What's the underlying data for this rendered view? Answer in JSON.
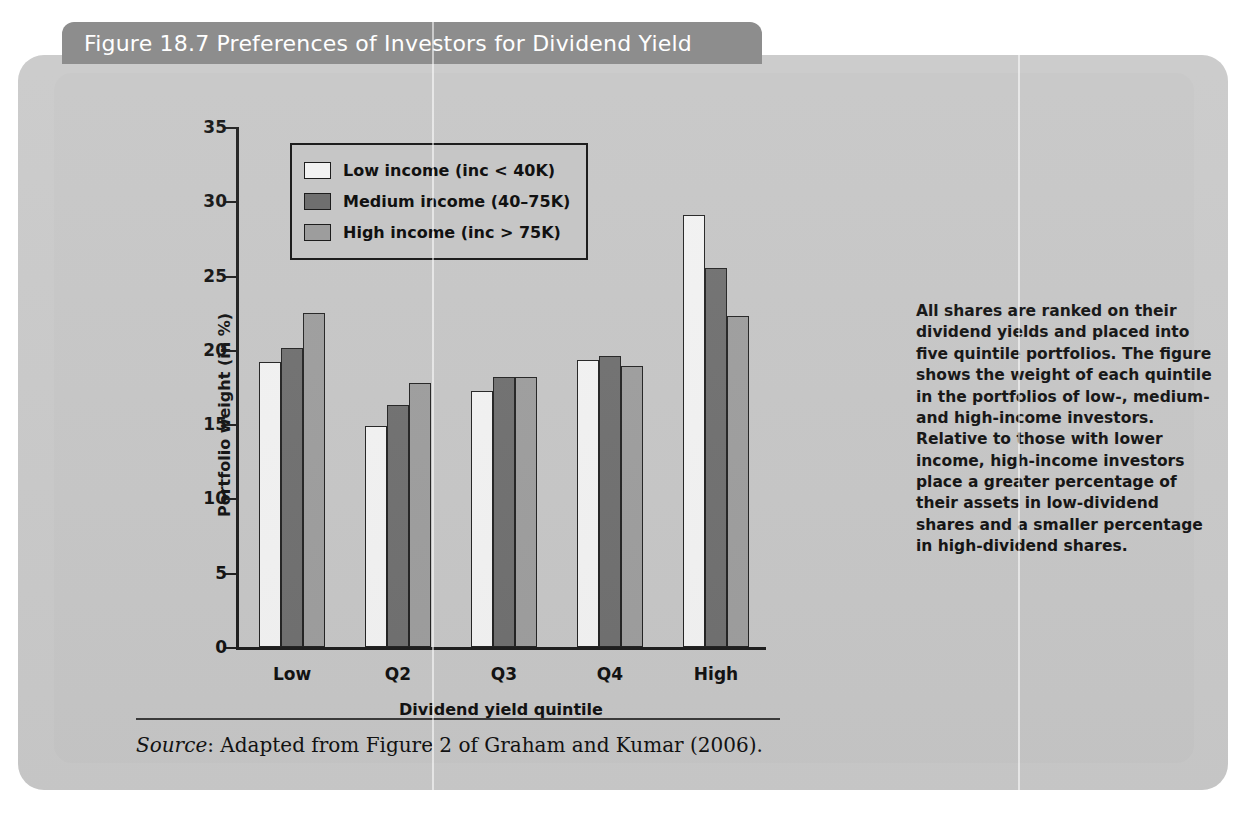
{
  "figure": {
    "title": "Figure 18.7  Preferences of Investors for Dividend Yield",
    "source_prefix": "Source",
    "source_text": ": Adapted from Figure 2 of Graham and Kumar (2006).",
    "caption": "All shares are ranked on their dividend yields and placed into five quintile portfolios. The figure shows the weight of each quintile in the portfolios of low-, medium- and high-income investors. Relative to those with lower income, high-income investors place a greater percentage of their assets in low-dividend shares and a smaller percentage in high-dividend shares."
  },
  "colors": {
    "card": "#c9c9c9",
    "plate": "#c6c6c6",
    "title_tab": "#8d8d8d",
    "title_text": "#ffffff",
    "axis": "#1d1d1d",
    "series_low": "#f2f2f2",
    "series_medium": "#6f6f6f",
    "series_high": "#9d9d9d"
  },
  "chart_data": {
    "type": "bar",
    "title": "Figure 18.7  Preferences of Investors for Dividend Yield",
    "xlabel": "Dividend yield quintile",
    "ylabel": "Portfolio weight (in %)",
    "categories": [
      "Low",
      "Q2",
      "Q3",
      "Q4",
      "High"
    ],
    "ylim": [
      0,
      35
    ],
    "yticks": [
      0,
      5,
      10,
      15,
      20,
      25,
      30,
      35
    ],
    "grid": false,
    "legend_position": "upper-left-inside",
    "series": [
      {
        "name": "Low income (inc < 40K)",
        "color": "#f2f2f2",
        "values": [
          19.2,
          14.9,
          17.2,
          19.3,
          29.1
        ]
      },
      {
        "name": "Medium income (40–75K)",
        "color": "#6f6f6f",
        "values": [
          20.1,
          16.3,
          18.2,
          19.6,
          25.5
        ]
      },
      {
        "name": "High income (inc > 75K)",
        "color": "#9d9d9d",
        "values": [
          22.5,
          17.8,
          18.2,
          18.9,
          22.3
        ]
      }
    ]
  }
}
